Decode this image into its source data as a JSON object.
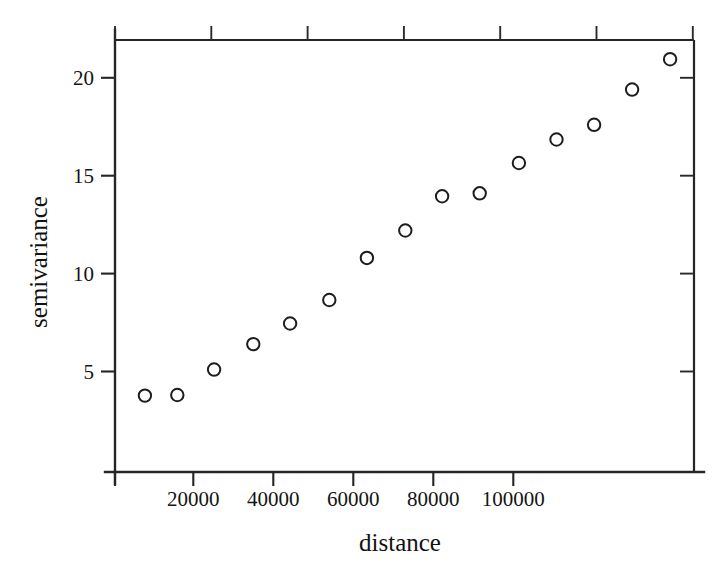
{
  "chart_data": {
    "type": "scatter",
    "title": "",
    "xlabel": "distance",
    "ylabel": "semivariance",
    "xlim": [
      0,
      120250
    ],
    "ylim": [
      1.2,
      21.8
    ],
    "grid": false,
    "legend": null,
    "marker": "open-circle",
    "x": [
      7900,
      16000,
      25200,
      35000,
      44200,
      54000,
      63400,
      73000,
      82200,
      91600,
      101400,
      110800,
      120200,
      129700,
      139200
    ],
    "y": [
      3.77,
      3.8,
      5.1,
      6.4,
      7.45,
      8.65,
      10.8,
      12.2,
      13.95,
      14.1,
      15.65,
      16.85,
      17.6,
      19.4,
      20.95
    ],
    "points": [
      {
        "x": 7900,
        "y": 3.77
      },
      {
        "x": 16000,
        "y": 3.8
      },
      {
        "x": 25200,
        "y": 5.1
      },
      {
        "x": 35000,
        "y": 6.4
      },
      {
        "x": 44200,
        "y": 7.45
      },
      {
        "x": 54000,
        "y": 8.65
      },
      {
        "x": 63400,
        "y": 10.8
      },
      {
        "x": 73000,
        "y": 12.2
      },
      {
        "x": 82200,
        "y": 13.95
      },
      {
        "x": 91600,
        "y": 14.1
      },
      {
        "x": 101400,
        "y": 15.65
      },
      {
        "x": 110800,
        "y": 16.85
      },
      {
        "x": 120200,
        "y": 17.6
      },
      {
        "x": 129700,
        "y": 19.4
      },
      {
        "x": 139200,
        "y": 20.95
      }
    ],
    "xticks": [
      {
        "value": 20000,
        "label": "20000"
      },
      {
        "value": 40000,
        "label": "40000"
      },
      {
        "value": 60000,
        "label": "60000"
      },
      {
        "value": 80000,
        "label": "80000"
      },
      {
        "value": 100000,
        "label": "100000"
      }
    ],
    "yticks": [
      {
        "value": 20,
        "label": "20"
      },
      {
        "value": 15,
        "label": "15"
      },
      {
        "value": 10,
        "label": "10"
      },
      {
        "value": 5,
        "label": "5"
      }
    ]
  },
  "colors": {
    "axis": "#252525",
    "marker_stroke": "#1d1d1d",
    "text": "#141414",
    "background": "#ffffff"
  }
}
